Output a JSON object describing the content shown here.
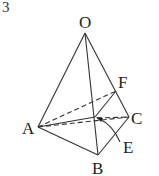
{
  "problem_number": "3",
  "diagram": {
    "type": "tetrahedron",
    "vertices": {
      "O": {
        "label": "O",
        "x": 85,
        "y": 33
      },
      "A": {
        "label": "A",
        "x": 38,
        "y": 127
      },
      "B": {
        "label": "B",
        "x": 98,
        "y": 155
      },
      "C": {
        "label": "C",
        "x": 129,
        "y": 117
      },
      "F": {
        "label": "F",
        "x": 116,
        "y": 91
      },
      "E": {
        "label": "E",
        "x": 120,
        "y": 140
      }
    },
    "labels": {
      "O": "O",
      "A": "A",
      "B": "B",
      "C": "C",
      "F": "F",
      "E": "E"
    }
  }
}
